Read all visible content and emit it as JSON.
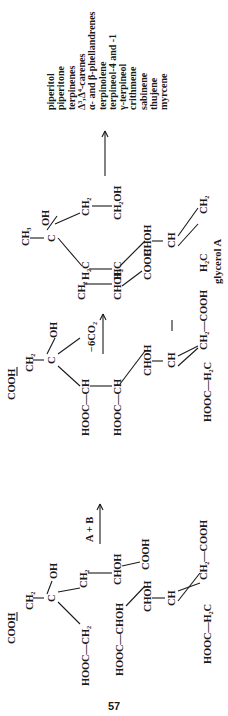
{
  "page_number": "57",
  "reactions": {
    "step1_label": "A + B",
    "step2_label": "−6CO₂",
    "product_label": "glycerol A"
  },
  "structure_left": {
    "atoms": [
      "COOH",
      "CH₂",
      "C",
      "OH",
      "CH₂",
      "HOOC—CH₂",
      "CHOH",
      "COOH",
      "HOOC—CHOH",
      "CHOH",
      "CH",
      "CH₂—COOH",
      "HOOC—H₂C"
    ]
  },
  "structure_middle": {
    "atoms": [
      "COOH",
      "CH₂",
      "C",
      "OH",
      "CH₂",
      "CHOH",
      "COOH",
      "HOOC—CH",
      "HOOC—CH",
      "CHOH",
      "CH",
      "CH₂—COOH",
      "HOOC—H₂C"
    ]
  },
  "structure_glycerol": {
    "atoms": [
      "CH₃",
      "C",
      "OH",
      "CH₂",
      "CH₂OH",
      "H₂C",
      "H₂C",
      "CHOH",
      "CH",
      "H₂C",
      "CH₂"
    ]
  },
  "products": [
    "piperitol",
    "piperitone",
    "terpinenes",
    "Δ³,Δ⁴-carenes",
    "α- and β-phellandrenes",
    "terpinolene",
    "terpineol-4 and -1",
    "γ-terpineol",
    "crithmene",
    "sabinene",
    "thujene",
    "myrcene"
  ]
}
